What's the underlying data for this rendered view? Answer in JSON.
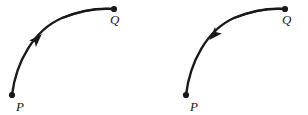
{
  "figure": {
    "background_color": "#ffffff",
    "ink_color": "#1a1a1a",
    "caption": "",
    "panels": [
      {
        "id": "left-panel",
        "name": "arc-from-P-to-Q",
        "direction": "forward",
        "arrow_points_toward": "Q",
        "start_label": "P",
        "end_label": "Q",
        "start_point": {
          "x": 12,
          "y": 95
        },
        "end_point": {
          "x": 114,
          "y": 9
        },
        "arrow_position": {
          "x": 37,
          "y": 39
        },
        "arrow_angle_deg": -47,
        "start_label_position": {
          "x": 16,
          "y": 111
        },
        "end_label_position": {
          "x": 110,
          "y": 24
        }
      },
      {
        "id": "right-panel",
        "name": "arc-from-Q-to-P",
        "direction": "reverse",
        "arrow_points_toward": "P",
        "start_label": "P",
        "end_label": "Q",
        "start_point": {
          "x": 186,
          "y": 95
        },
        "end_point": {
          "x": 285,
          "y": 9
        },
        "arrow_position": {
          "x": 214,
          "y": 35
        },
        "arrow_angle_deg": 133,
        "start_label_position": {
          "x": 190,
          "y": 111
        },
        "end_label_position": {
          "x": 282,
          "y": 24
        }
      }
    ]
  },
  "labels": {
    "p": "P",
    "q": "Q"
  }
}
